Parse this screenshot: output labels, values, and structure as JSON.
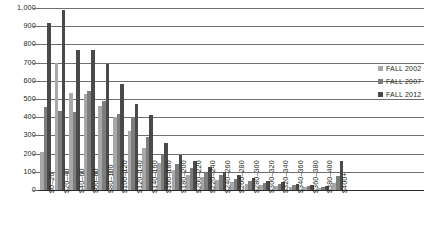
{
  "chart_data": {
    "type": "bar",
    "title": "",
    "subtitle": "",
    "xlabel": "",
    "ylabel": "",
    "ylim": [
      0,
      1000
    ],
    "ytick_step": 100,
    "grid": true,
    "legend_position": "right",
    "orientation": "vertical",
    "grouping": "grouped",
    "categories": [
      "$0–20",
      "$20–40",
      "$40–60",
      "$60–80",
      "$80–100",
      "$100–120",
      "$120–140",
      "$140–160",
      "$160–180",
      "$180–200",
      "$200–220",
      "$220–240",
      "$240–260",
      "$260–280",
      "$280–300",
      "$300–320",
      "$320–340",
      "$340–360",
      "$360–380",
      "$380–400",
      "$400+"
    ],
    "ytick_labels": [
      "0",
      "100",
      "200",
      "300",
      "400",
      "500",
      "600",
      "700",
      "800",
      "900",
      "1,000"
    ],
    "ytick_values": [
      0,
      100,
      200,
      300,
      400,
      500,
      600,
      700,
      800,
      900,
      1000
    ],
    "series": [
      {
        "name": "FALL 2002",
        "color": "#a8a8a8",
        "values": [
          210,
          700,
          535,
          530,
          460,
          400,
          325,
          230,
          150,
          110,
          85,
          70,
          55,
          45,
          35,
          28,
          22,
          18,
          15,
          12,
          40
        ]
      },
      {
        "name": "FALL 2007",
        "color": "#7d7d7d",
        "values": [
          455,
          435,
          430,
          545,
          490,
          420,
          400,
          290,
          195,
          145,
          120,
          95,
          80,
          62,
          50,
          40,
          32,
          26,
          22,
          18,
          75
        ]
      },
      {
        "name": "FALL 2012",
        "color": "#4a4a4a",
        "values": [
          915,
          990,
          770,
          770,
          695,
          580,
          475,
          410,
          260,
          190,
          160,
          125,
          100,
          80,
          65,
          52,
          42,
          34,
          28,
          24,
          160
        ]
      }
    ]
  },
  "legend": {
    "items": [
      {
        "label": "FALL 2002"
      },
      {
        "label": "FALL 2007"
      },
      {
        "label": "FALL 2012"
      }
    ]
  }
}
